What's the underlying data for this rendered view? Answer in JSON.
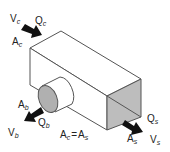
{
  "diagram": {
    "colors": {
      "line": "#555555",
      "face_fill": "#ffffff",
      "outlet_fill": "#bdbdbd",
      "branch_fill": "#b0b0b0",
      "arrow": "#111111",
      "text": "#222222"
    },
    "inlet": {
      "velocity": {
        "base": "V",
        "sub": "c"
      },
      "flow": {
        "base": "Q",
        "sub": "c"
      },
      "area": {
        "base": "A",
        "sub": "c"
      }
    },
    "branch": {
      "area": {
        "base": "A",
        "sub": "b"
      },
      "velocity": {
        "base": "V",
        "sub": "b"
      },
      "flow": {
        "base": "Q",
        "sub": "b"
      }
    },
    "straight": {
      "flow": {
        "base": "Q",
        "sub": "s"
      },
      "area": {
        "base": "A",
        "sub": "s"
      },
      "velocity": {
        "base": "V",
        "sub": "s"
      }
    },
    "equation": {
      "lhs": {
        "base": "A",
        "sub": "c"
      },
      "op": "=",
      "rhs": {
        "base": "A",
        "sub": "s"
      }
    }
  }
}
